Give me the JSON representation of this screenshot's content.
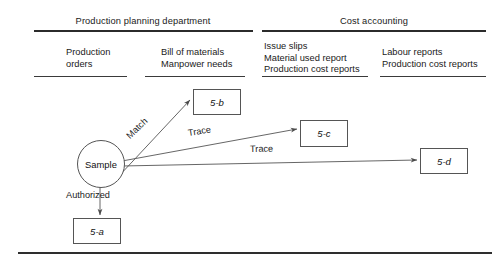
{
  "diagram": {
    "departments": [
      {
        "name": "Production planning department",
        "x": 143,
        "columns": [
          {
            "lines": [
              "Production",
              "orders"
            ],
            "x": 66,
            "y": 47
          },
          {
            "lines": [
              "Bill of materials",
              "Manpower needs"
            ],
            "x": 161,
            "y": 47
          }
        ]
      },
      {
        "name": "Cost accounting",
        "x": 374,
        "columns": [
          {
            "lines": [
              "Issue slips",
              "Material used report",
              "Production cost reports"
            ],
            "x": 264,
            "y": 41
          },
          {
            "lines": [
              "Labour reports",
              "Production cost reports"
            ],
            "x": 382,
            "y": 47
          }
        ]
      }
    ],
    "rules": [
      {
        "name": "rule-top-left",
        "x": 34,
        "y": 30,
        "w": 219
      },
      {
        "name": "rule-top-right",
        "x": 262,
        "y": 30,
        "w": 224
      },
      {
        "name": "rule-col-1",
        "x": 34,
        "y": 76,
        "w": 93
      },
      {
        "name": "rule-col-2",
        "x": 145,
        "y": 76,
        "w": 100
      },
      {
        "name": "rule-col-3",
        "x": 262,
        "y": 76,
        "w": 106
      },
      {
        "name": "rule-col-4",
        "x": 380,
        "y": 76,
        "w": 106
      }
    ],
    "nodes": {
      "sample": {
        "label": "Sample",
        "cx": 100,
        "cy": 163,
        "r": 23
      },
      "boxes": [
        {
          "name": "node-5-b",
          "label": "5-b",
          "x": 193,
          "y": 89,
          "w": 46,
          "h": 24
        },
        {
          "name": "node-5-c",
          "label": "5-c",
          "x": 300,
          "y": 120,
          "w": 46,
          "h": 25
        },
        {
          "name": "node-5-d",
          "label": "5-d",
          "x": 420,
          "y": 148,
          "w": 46,
          "h": 24
        },
        {
          "name": "node-5-a",
          "label": "5-a",
          "x": 73,
          "y": 218,
          "w": 46,
          "h": 24
        }
      ]
    },
    "edges": [
      {
        "name": "edge-match",
        "label": "Match",
        "x1": 118,
        "y1": 177,
        "x2": 190,
        "y2": 100,
        "lx": 128,
        "ly": 132,
        "rot": -44
      },
      {
        "name": "edge-trace-5c",
        "label": "Trace",
        "x1": 122,
        "y1": 161,
        "x2": 297,
        "y2": 129,
        "lx": 188,
        "ly": 128,
        "rot": -9
      },
      {
        "name": "edge-trace-5d",
        "label": "Trace",
        "x1": 122,
        "y1": 166,
        "x2": 417,
        "y2": 160,
        "lx": 250,
        "ly": 144,
        "rot": -1
      },
      {
        "name": "edge-authorized",
        "label": "Authorized",
        "x1": 100,
        "y1": 186,
        "x2": 100,
        "y2": 215,
        "lx": 66,
        "ly": 190,
        "rot": 0
      }
    ]
  }
}
